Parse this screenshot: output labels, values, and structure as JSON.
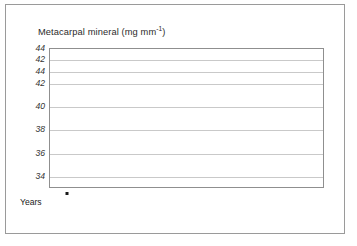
{
  "figure": {
    "title_main": "Metacarpal mineral (mg mm",
    "title_sup": "-1",
    "title_close": ")",
    "title_full": "Metacarpal mineral (mg mm-1)",
    "border_color": "#9a9a9a",
    "shadow_color": "#d9d9d9"
  },
  "axes": {
    "x_axis_name": "Years",
    "y_tick_labels": [
      "44",
      "42",
      "44",
      "42",
      "40",
      "38",
      "36",
      "34"
    ],
    "x_tick_labels": [
      "2",
      "4",
      "6",
      "8",
      "10",
      "12",
      "14",
      "16"
    ],
    "grid_color": "#c9c9c9",
    "axis_color": "#8f8f8f"
  },
  "chart_data": {
    "type": "line",
    "title": "Metacarpal mineral (mg mm-1)",
    "xlabel": "Years",
    "ylabel": "Metacarpal mineral (mg mm-1)",
    "xlim": [
      1,
      16.6
    ],
    "ylim": [
      33.0,
      45.0
    ],
    "y_tick_values": [
      45,
      44,
      43,
      42,
      40,
      38,
      36,
      34
    ],
    "y_tick_labels": [
      "44",
      "42",
      "44",
      "42",
      "40",
      "38",
      "36",
      "34"
    ],
    "x_ticks": [
      2,
      4,
      6,
      8,
      10,
      12,
      14,
      16
    ],
    "grid": "horizontal",
    "legend": "series-end-labels",
    "series": [
      {
        "name": "0",
        "label": "0",
        "color": "#161616",
        "width": 2.6,
        "x": [
          2.0,
          2.6,
          3.2,
          3.8,
          4.4,
          5.0,
          5.6,
          6.2,
          6.8,
          7.4,
          8.0,
          8.6,
          9.2,
          9.8
        ],
        "values": [
          43.9,
          44.1,
          44.2,
          44.0,
          44.3,
          43.9,
          43.5,
          43.9,
          44.1,
          44.0,
          44.6,
          43.9,
          43.3,
          44.4
        ]
      },
      {
        "name": "3",
        "label": "3",
        "color": "#5a5a5a",
        "width": 2.6,
        "x": [
          3.0,
          3.7,
          4.4,
          5.1,
          5.8,
          6.5,
          7.2,
          7.9,
          8.6,
          9.3,
          10.0,
          10.7,
          11.4,
          12.1,
          12.8
        ],
        "values": [
          41.0,
          42.0,
          42.9,
          43.2,
          42.5,
          43.1,
          43.5,
          43.2,
          43.6,
          43.0,
          42.9,
          43.0,
          42.9,
          43.0,
          42.1
        ]
      },
      {
        "name": "6",
        "label": "6",
        "color": "#8e8e8e",
        "width": 2.4,
        "x": [
          6.0,
          6.6,
          7.2,
          7.8,
          8.4,
          9.0,
          9.6,
          10.2,
          10.8,
          11.4,
          12.0,
          12.6,
          13.2,
          13.8,
          14.4,
          15.0,
          15.6,
          16.0
        ],
        "values": [
          39.8,
          40.0,
          40.2,
          40.2,
          40.1,
          40.2,
          39.8,
          39.4,
          39.6,
          39.8,
          39.3,
          38.8,
          39.5,
          39.9,
          39.4,
          40.2,
          40.4,
          39.8
        ]
      },
      {
        "name": "Placebo",
        "label": "Placebo",
        "color": "#cfcfcf",
        "width": 2.6,
        "x": [
          2.0,
          2.8,
          3.6,
          4.4,
          5.2,
          6.0,
          6.8,
          7.6,
          8.4,
          9.2,
          10.0,
          10.8,
          11.6,
          12.4,
          13.2,
          14.0,
          14.8
        ],
        "values": [
          42.0,
          41.6,
          41.2,
          40.7,
          40.3,
          39.9,
          39.4,
          39.0,
          38.7,
          38.5,
          38.1,
          37.6,
          37.2,
          36.9,
          36.4,
          36.0,
          35.4
        ]
      }
    ]
  },
  "series_labels": [
    {
      "text": "0",
      "left": 206,
      "top": 63
    },
    {
      "text": "3",
      "left": 253,
      "top": 93
    },
    {
      "text": "6",
      "left": 301,
      "top": 113
    },
    {
      "text": "Placebo",
      "left": 272,
      "top": 167
    }
  ]
}
